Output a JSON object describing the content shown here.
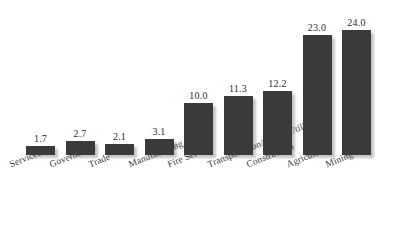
{
  "chart_data": {
    "type": "bar",
    "title": "",
    "subtitle": "",
    "xlabel": "",
    "ylabel": "",
    "ylim": [
      0,
      24
    ],
    "grid": false,
    "legend": false,
    "legend_position": "none",
    "orientation": "vertical",
    "bar_color": "#3a3a3a",
    "background_color": "#ffffff",
    "value_label_format": "one-decimal",
    "categories": [
      "Services",
      "Government",
      "Trade",
      "Manufacturing",
      "Fire Service",
      "Transportation/Public Utilities",
      "Construction",
      "Agriculture",
      "Mining"
    ],
    "values": [
      1.7,
      2.7,
      2.1,
      3.1,
      10.0,
      11.3,
      12.2,
      23.0,
      24.0
    ],
    "value_labels": [
      "1.7",
      "2.7",
      "2.1",
      "3.1",
      "10.0",
      "11.3",
      "12.2",
      "23.0",
      "24.0"
    ]
  }
}
